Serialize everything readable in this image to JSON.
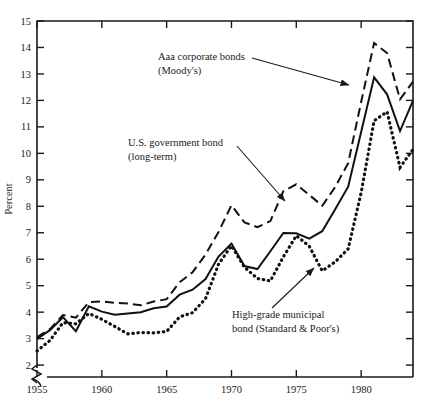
{
  "figure": {
    "name": "interest-rates-on-bonds-line-chart",
    "axis_title_y": "Percent",
    "top_cut_text": ""
  },
  "chart_data": {
    "type": "line",
    "title": "",
    "subtitle": "",
    "xlabel": "",
    "ylabel": "Percent",
    "xlim": [
      1955,
      1984
    ],
    "ylim": [
      1.55,
      15
    ],
    "y_axis_break": true,
    "y_break_label": "axis-break-below-2",
    "grid": false,
    "legend_position": "inline-annotations",
    "yticks": [
      2,
      3,
      4,
      5,
      6,
      7,
      8,
      9,
      10,
      11,
      12,
      13,
      14,
      15
    ],
    "ytick_labels": [
      "2",
      "3",
      "4",
      "5",
      "6",
      "7",
      "8",
      "9",
      "10",
      "11",
      "12",
      "13",
      "14",
      "15"
    ],
    "xticks": [
      1955,
      1960,
      1965,
      1970,
      1975,
      1980
    ],
    "xtick_labels": [
      "1955",
      "1960",
      "1965",
      "1970",
      "1975",
      "1980"
    ],
    "x": [
      1955,
      1956,
      1957,
      1958,
      1959,
      1960,
      1961,
      1962,
      1963,
      1964,
      1965,
      1966,
      1967,
      1968,
      1969,
      1970,
      1971,
      1972,
      1973,
      1974,
      1975,
      1976,
      1977,
      1978,
      1979,
      1980,
      1981,
      1982,
      1983,
      1984
    ],
    "series": [
      {
        "name": "Aaa corporate bonds (Moody's)",
        "style": "dashed",
        "color": "#111111",
        "values": [
          3.06,
          3.36,
          3.89,
          3.79,
          4.38,
          4.41,
          4.35,
          4.33,
          4.26,
          4.4,
          4.49,
          5.13,
          5.51,
          6.18,
          7.03,
          8.04,
          7.39,
          7.21,
          7.44,
          8.57,
          8.83,
          8.43,
          8.02,
          8.73,
          9.63,
          11.94,
          14.17,
          13.79,
          12.04,
          12.71
        ]
      },
      {
        "name": "U.S. government bond (long-term)",
        "style": "solid",
        "color": "#111111",
        "values": [
          2.99,
          3.32,
          3.81,
          3.28,
          4.22,
          4.02,
          3.9,
          3.95,
          4.0,
          4.15,
          4.21,
          4.66,
          4.85,
          5.25,
          6.1,
          6.59,
          5.74,
          5.63,
          6.3,
          6.99,
          6.98,
          6.78,
          7.06,
          7.89,
          8.74,
          10.81,
          12.87,
          12.23,
          10.84,
          11.99
        ]
      },
      {
        "name": "High-grade municipal bond (Standard & Poor's)",
        "style": "dotted",
        "color": "#111111",
        "values": [
          2.53,
          2.93,
          3.6,
          3.56,
          3.95,
          3.73,
          3.46,
          3.18,
          3.23,
          3.22,
          3.27,
          3.82,
          3.98,
          4.51,
          5.81,
          6.51,
          5.7,
          5.27,
          5.18,
          6.09,
          6.89,
          6.49,
          5.56,
          5.9,
          6.39,
          8.51,
          11.23,
          11.57,
          9.47,
          10.15
        ]
      }
    ],
    "annotations": [
      {
        "id": "annot-aaa",
        "lines": [
          "Aaa corporate bonds",
          "(Moody's)"
        ],
        "text_x": 158,
        "text_y": 60,
        "leader_from_x": 252,
        "leader_from_y": 58,
        "leader_to_x": 349,
        "leader_to_y": 85,
        "arrow": true
      },
      {
        "id": "annot-usgov",
        "lines": [
          "U.S. government bond",
          "(long-term)"
        ],
        "text_x": 128,
        "text_y": 146,
        "leader_from_x": 237,
        "leader_from_y": 146,
        "leader_to_x": 285,
        "leader_to_y": 201,
        "arrow": true
      },
      {
        "id": "annot-muni",
        "lines": [
          "High-grade municipal",
          "bond (Standard & Poor's)"
        ],
        "text_x": 232,
        "text_y": 318,
        "leader_from_x": 272,
        "leader_from_y": 308,
        "leader_to_x": 314,
        "leader_to_y": 268,
        "arrow": true
      }
    ]
  }
}
